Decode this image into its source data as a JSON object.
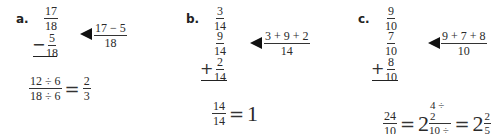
{
  "problems": {
    "a": {
      "label": "a.",
      "f1": {
        "n": "17",
        "d": "18"
      },
      "op": "−",
      "f2": {
        "n": "5",
        "d": "18"
      },
      "hint": {
        "n": "17 − 5",
        "d": "18"
      },
      "result": {
        "lhs": {
          "n": "12 ÷ 6",
          "d": "18 ÷ 6"
        },
        "eq": "=",
        "rhs": {
          "n": "2",
          "d": "3"
        }
      }
    },
    "b": {
      "label": "b.",
      "f1": {
        "n": "3",
        "d": "14"
      },
      "f2": {
        "n": "9",
        "d": "14"
      },
      "op": "+",
      "f3": {
        "n": "2",
        "d": "14"
      },
      "hint": {
        "n": "3 + 9 + 2",
        "d": "14"
      },
      "result": {
        "lhs": {
          "n": "14",
          "d": "14"
        },
        "eq": "=",
        "rhs": "1"
      }
    },
    "c": {
      "label": "c.",
      "f1": {
        "n": "9",
        "d": "10"
      },
      "f2": {
        "n": "7",
        "d": "10"
      },
      "op": "+",
      "f3": {
        "n": "8",
        "d": "10"
      },
      "hint": {
        "n": "9 + 7 + 8",
        "d": "10"
      },
      "result": {
        "lhs": {
          "n": "24",
          "d": "10"
        },
        "eq1": "=",
        "whole1": "2",
        "mid": {
          "n": "4 ÷ 2",
          "d": "10 ÷ 2"
        },
        "eq2": "=",
        "whole2": "2",
        "rhs": {
          "n": "2",
          "d": "5"
        }
      }
    }
  }
}
